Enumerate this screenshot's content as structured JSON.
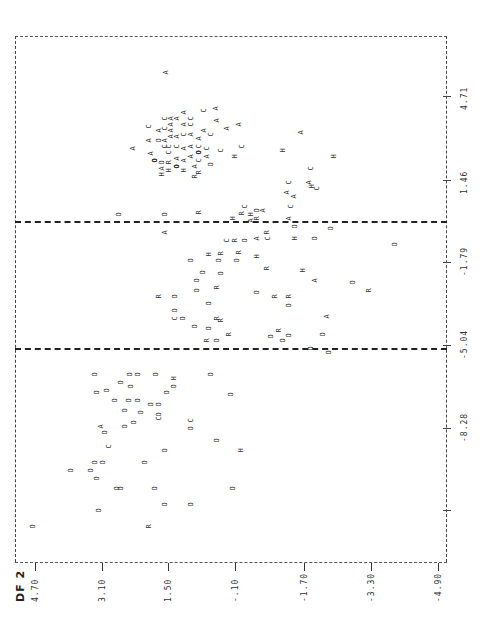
{
  "chart_data": {
    "type": "scatter",
    "title": "",
    "orientation": "rotated 90 degrees counter-clockwise (line-printer territorial map)",
    "xlabel": "DF 2",
    "ylabel": "DF 1",
    "x_axis": {
      "label": "DF 2",
      "ticks": [
        "4.70",
        "3.10",
        "1.50",
        "-.10",
        "-1.70",
        "-3.30",
        "-4.90"
      ],
      "range": [
        4.7,
        -4.9
      ]
    },
    "y_axis": {
      "label": "DF 1",
      "ticks": [
        "4.71",
        "1.46",
        "-1.79",
        "-5.04",
        "-8.28"
      ],
      "range": [
        4.71,
        -8.28
      ]
    },
    "grid": false,
    "legend": null,
    "group_symbols": [
      "A",
      "C",
      "H",
      "R",
      "O"
    ],
    "boundaries": [
      {
        "type": "dashed",
        "axis": "DF1",
        "approx_value": -0.2
      },
      {
        "type": "dashed",
        "axis": "DF1",
        "approx_value": -3.3
      }
    ],
    "clusters": [
      {
        "symbol_mix": "A,C dominant",
        "region": "DF1 > 0, DF2 0.5 to 3.0",
        "approx_center": {
          "df1": 2.0,
          "df2": 1.5
        }
      },
      {
        "symbol_mix": "O,R,H mixed",
        "region": "DF1 -3.3 to -0.2",
        "approx_center": {
          "df1": -1.8,
          "df2": 0.0
        }
      },
      {
        "symbol_mix": "O dominant",
        "region": "DF1 < -3.3",
        "approx_center": {
          "df1": -5.5,
          "df2": 2.0
        }
      }
    ],
    "points": [
      {
        "s": "A",
        "x": 167,
        "y": 72
      },
      {
        "s": "A",
        "x": 217,
        "y": 108
      },
      {
        "s": "A",
        "x": 134,
        "y": 148
      },
      {
        "s": "A",
        "x": 152,
        "y": 153
      },
      {
        "s": "C",
        "x": 150,
        "y": 126
      },
      {
        "s": "A",
        "x": 150,
        "y": 140
      },
      {
        "s": "O",
        "x": 160,
        "y": 140
      },
      {
        "s": "A",
        "x": 160,
        "y": 130
      },
      {
        "s": "C",
        "x": 166,
        "y": 118
      },
      {
        "s": "C",
        "x": 166,
        "y": 128
      },
      {
        "s": "A",
        "x": 166,
        "y": 140
      },
      {
        "s": "C",
        "x": 166,
        "y": 146
      },
      {
        "s": "A",
        "x": 172,
        "y": 118
      },
      {
        "s": "A",
        "x": 172,
        "y": 124
      },
      {
        "s": "A",
        "x": 172,
        "y": 130
      },
      {
        "s": "A",
        "x": 172,
        "y": 136
      },
      {
        "s": "Q",
        "x": 156,
        "y": 160
      },
      {
        "s": "O",
        "x": 163,
        "y": 162
      },
      {
        "s": "A",
        "x": 163,
        "y": 168
      },
      {
        "s": "H",
        "x": 163,
        "y": 174
      },
      {
        "s": "H",
        "x": 170,
        "y": 170
      },
      {
        "s": "R",
        "x": 170,
        "y": 162
      },
      {
        "s": "C",
        "x": 170,
        "y": 152
      },
      {
        "s": "C",
        "x": 170,
        "y": 146
      },
      {
        "s": "A",
        "x": 178,
        "y": 118
      },
      {
        "s": "A",
        "x": 178,
        "y": 136
      },
      {
        "s": "C",
        "x": 178,
        "y": 146
      },
      {
        "s": "A",
        "x": 178,
        "y": 158
      },
      {
        "s": "Q",
        "x": 178,
        "y": 166
      },
      {
        "s": "H",
        "x": 185,
        "y": 170
      },
      {
        "s": "A",
        "x": 185,
        "y": 160
      },
      {
        "s": "A",
        "x": 185,
        "y": 148
      },
      {
        "s": "C",
        "x": 185,
        "y": 134
      },
      {
        "s": "A",
        "x": 185,
        "y": 124
      },
      {
        "s": "A",
        "x": 185,
        "y": 112
      },
      {
        "s": "C",
        "x": 192,
        "y": 118
      },
      {
        "s": "C",
        "x": 192,
        "y": 124
      },
      {
        "s": "A",
        "x": 192,
        "y": 134
      },
      {
        "s": "A",
        "x": 192,
        "y": 146
      },
      {
        "s": "A",
        "x": 192,
        "y": 156
      },
      {
        "s": "A",
        "x": 196,
        "y": 166
      },
      {
        "s": "R",
        "x": 196,
        "y": 176
      },
      {
        "s": "C",
        "x": 200,
        "y": 160
      },
      {
        "s": "R",
        "x": 200,
        "y": 172
      },
      {
        "s": "A",
        "x": 200,
        "y": 138
      },
      {
        "s": "C",
        "x": 200,
        "y": 146
      },
      {
        "s": "Q",
        "x": 200,
        "y": 152
      },
      {
        "s": "C",
        "x": 205,
        "y": 110
      },
      {
        "s": "A",
        "x": 205,
        "y": 130
      },
      {
        "s": "C",
        "x": 208,
        "y": 148
      },
      {
        "s": "A",
        "x": 208,
        "y": 156
      },
      {
        "s": "C",
        "x": 212,
        "y": 134
      },
      {
        "s": "O",
        "x": 212,
        "y": 164
      },
      {
        "s": "A",
        "x": 218,
        "y": 120
      },
      {
        "s": "A",
        "x": 228,
        "y": 128
      },
      {
        "s": "C",
        "x": 222,
        "y": 150
      },
      {
        "s": "H",
        "x": 236,
        "y": 156
      },
      {
        "s": "A",
        "x": 240,
        "y": 124
      },
      {
        "s": "C",
        "x": 243,
        "y": 146
      },
      {
        "s": "H",
        "x": 284,
        "y": 150
      },
      {
        "s": "A",
        "x": 302,
        "y": 132
      },
      {
        "s": "C",
        "x": 312,
        "y": 168
      },
      {
        "s": "A",
        "x": 310,
        "y": 182
      },
      {
        "s": "H",
        "x": 313,
        "y": 186
      },
      {
        "s": "H",
        "x": 335,
        "y": 156
      },
      {
        "s": "C",
        "x": 318,
        "y": 188
      },
      {
        "s": "A",
        "x": 295,
        "y": 196
      },
      {
        "s": "C",
        "x": 292,
        "y": 206
      },
      {
        "s": "C",
        "x": 290,
        "y": 182
      },
      {
        "s": "A",
        "x": 288,
        "y": 192
      },
      {
        "s": "A",
        "x": 290,
        "y": 218
      },
      {
        "s": "O",
        "x": 296,
        "y": 226
      },
      {
        "s": "H",
        "x": 296,
        "y": 238
      },
      {
        "s": "O",
        "x": 316,
        "y": 238
      },
      {
        "s": "O",
        "x": 332,
        "y": 228
      },
      {
        "s": "O",
        "x": 396,
        "y": 244
      },
      {
        "s": "O",
        "x": 120,
        "y": 214
      },
      {
        "s": "A",
        "x": 166,
        "y": 232
      },
      {
        "s": "O",
        "x": 166,
        "y": 214
      },
      {
        "s": "R",
        "x": 200,
        "y": 212
      },
      {
        "s": "H",
        "x": 234,
        "y": 218
      },
      {
        "s": "R",
        "x": 243,
        "y": 213
      },
      {
        "s": "C",
        "x": 246,
        "y": 206
      },
      {
        "s": "H",
        "x": 252,
        "y": 214
      },
      {
        "s": "A",
        "x": 252,
        "y": 220
      },
      {
        "s": "O",
        "x": 258,
        "y": 210
      },
      {
        "s": "R",
        "x": 258,
        "y": 218
      },
      {
        "s": "A",
        "x": 264,
        "y": 210
      },
      {
        "s": "R",
        "x": 268,
        "y": 232
      },
      {
        "s": "C",
        "x": 269,
        "y": 238
      },
      {
        "s": "A",
        "x": 258,
        "y": 238
      },
      {
        "s": "O",
        "x": 246,
        "y": 240
      },
      {
        "s": "R",
        "x": 236,
        "y": 240
      },
      {
        "s": "C",
        "x": 228,
        "y": 240
      },
      {
        "s": "O",
        "x": 238,
        "y": 260
      },
      {
        "s": "O",
        "x": 220,
        "y": 260
      },
      {
        "s": "O",
        "x": 192,
        "y": 260
      },
      {
        "s": "H",
        "x": 210,
        "y": 254
      },
      {
        "s": "R",
        "x": 222,
        "y": 253
      },
      {
        "s": "R",
        "x": 240,
        "y": 252
      },
      {
        "s": "H",
        "x": 258,
        "y": 256
      },
      {
        "s": "R",
        "x": 268,
        "y": 268
      },
      {
        "s": "O",
        "x": 222,
        "y": 273
      },
      {
        "s": "O",
        "x": 204,
        "y": 272
      },
      {
        "s": "R",
        "x": 218,
        "y": 287
      },
      {
        "s": "O",
        "x": 198,
        "y": 280
      },
      {
        "s": "O",
        "x": 198,
        "y": 290
      },
      {
        "s": "O",
        "x": 210,
        "y": 303
      },
      {
        "s": "H",
        "x": 304,
        "y": 270
      },
      {
        "s": "A",
        "x": 316,
        "y": 280
      },
      {
        "s": "O",
        "x": 354,
        "y": 282
      },
      {
        "s": "R",
        "x": 370,
        "y": 290
      },
      {
        "s": "O",
        "x": 258,
        "y": 292
      },
      {
        "s": "R",
        "x": 276,
        "y": 296
      },
      {
        "s": "R",
        "x": 290,
        "y": 296
      },
      {
        "s": "O",
        "x": 290,
        "y": 305
      },
      {
        "s": "A",
        "x": 328,
        "y": 316
      },
      {
        "s": "O",
        "x": 176,
        "y": 296
      },
      {
        "s": "R",
        "x": 160,
        "y": 296
      },
      {
        "s": "O",
        "x": 176,
        "y": 310
      },
      {
        "s": "C",
        "x": 176,
        "y": 318
      },
      {
        "s": "O",
        "x": 184,
        "y": 318
      },
      {
        "s": "R",
        "x": 218,
        "y": 318
      },
      {
        "s": "R",
        "x": 222,
        "y": 320
      },
      {
        "s": "O",
        "x": 196,
        "y": 326
      },
      {
        "s": "O",
        "x": 210,
        "y": 328
      },
      {
        "s": "R",
        "x": 208,
        "y": 340
      },
      {
        "s": "O",
        "x": 218,
        "y": 340
      },
      {
        "s": "R",
        "x": 230,
        "y": 334
      },
      {
        "s": "O",
        "x": 272,
        "y": 336
      },
      {
        "s": "R",
        "x": 280,
        "y": 330
      },
      {
        "s": "O",
        "x": 284,
        "y": 340
      },
      {
        "s": "O",
        "x": 290,
        "y": 335
      },
      {
        "s": "O",
        "x": 324,
        "y": 334
      },
      {
        "s": "O",
        "x": 330,
        "y": 352
      },
      {
        "s": "O",
        "x": 312,
        "y": 348
      },
      {
        "s": "O",
        "x": 96,
        "y": 374
      },
      {
        "s": "O",
        "x": 98,
        "y": 392
      },
      {
        "s": "O",
        "x": 122,
        "y": 382
      },
      {
        "s": "O",
        "x": 131,
        "y": 374
      },
      {
        "s": "O",
        "x": 139,
        "y": 374
      },
      {
        "s": "O",
        "x": 108,
        "y": 390
      },
      {
        "s": "O",
        "x": 132,
        "y": 386
      },
      {
        "s": "O",
        "x": 157,
        "y": 374
      },
      {
        "s": "H",
        "x": 175,
        "y": 378
      },
      {
        "s": "O",
        "x": 175,
        "y": 386
      },
      {
        "s": "O",
        "x": 168,
        "y": 392
      },
      {
        "s": "O",
        "x": 212,
        "y": 374
      },
      {
        "s": "O",
        "x": 232,
        "y": 394
      },
      {
        "s": "O",
        "x": 116,
        "y": 400
      },
      {
        "s": "O",
        "x": 130,
        "y": 400
      },
      {
        "s": "O",
        "x": 139,
        "y": 400
      },
      {
        "s": "O",
        "x": 126,
        "y": 410
      },
      {
        "s": "O",
        "x": 152,
        "y": 404
      },
      {
        "s": "O",
        "x": 160,
        "y": 404
      },
      {
        "s": "O",
        "x": 142,
        "y": 412
      },
      {
        "s": "O",
        "x": 135,
        "y": 422
      },
      {
        "s": "C",
        "x": 160,
        "y": 418
      },
      {
        "s": "O",
        "x": 160,
        "y": 414
      },
      {
        "s": "O",
        "x": 126,
        "y": 426
      },
      {
        "s": "C",
        "x": 192,
        "y": 420
      },
      {
        "s": "O",
        "x": 192,
        "y": 428
      },
      {
        "s": "A",
        "x": 102,
        "y": 426
      },
      {
        "s": "O",
        "x": 106,
        "y": 432
      },
      {
        "s": "C",
        "x": 110,
        "y": 446
      },
      {
        "s": "O",
        "x": 166,
        "y": 450
      },
      {
        "s": "O",
        "x": 218,
        "y": 440
      },
      {
        "s": "H",
        "x": 242,
        "y": 450
      },
      {
        "s": "O",
        "x": 96,
        "y": 462
      },
      {
        "s": "O",
        "x": 104,
        "y": 462
      },
      {
        "s": "O",
        "x": 146,
        "y": 462
      },
      {
        "s": "O",
        "x": 72,
        "y": 470
      },
      {
        "s": "O",
        "x": 92,
        "y": 470
      },
      {
        "s": "O",
        "x": 98,
        "y": 478
      },
      {
        "s": "O",
        "x": 118,
        "y": 488
      },
      {
        "s": "O",
        "x": 122,
        "y": 488
      },
      {
        "s": "O",
        "x": 156,
        "y": 488
      },
      {
        "s": "O",
        "x": 234,
        "y": 488
      },
      {
        "s": "O",
        "x": 166,
        "y": 504
      },
      {
        "s": "O",
        "x": 192,
        "y": 504
      },
      {
        "s": "O",
        "x": 100,
        "y": 510
      },
      {
        "s": "O",
        "x": 34,
        "y": 526
      },
      {
        "s": "R",
        "x": 150,
        "y": 526
      }
    ]
  },
  "axes": {
    "bottom_title": "DF 2",
    "bottom_ticks": [
      {
        "label": "4.70",
        "x": 35
      },
      {
        "label": "3.10",
        "x": 102
      },
      {
        "label": "1.50",
        "x": 168
      },
      {
        "label": "-.10",
        "x": 235
      },
      {
        "label": "-1.70",
        "x": 304
      },
      {
        "label": "-3.30",
        "x": 371
      },
      {
        "label": "-4.90",
        "x": 438
      }
    ],
    "right_ticks": [
      {
        "label": "4.71",
        "y": 96
      },
      {
        "label": "1.46",
        "y": 180
      },
      {
        "label": "-1.79",
        "y": 262
      },
      {
        "label": "-5.04",
        "y": 345
      },
      {
        "label": "-8.28",
        "y": 428
      },
      {
        "label": "",
        "y": 510
      }
    ]
  },
  "style": {
    "ink": "#2a2a2a",
    "background": "#ffffff"
  }
}
